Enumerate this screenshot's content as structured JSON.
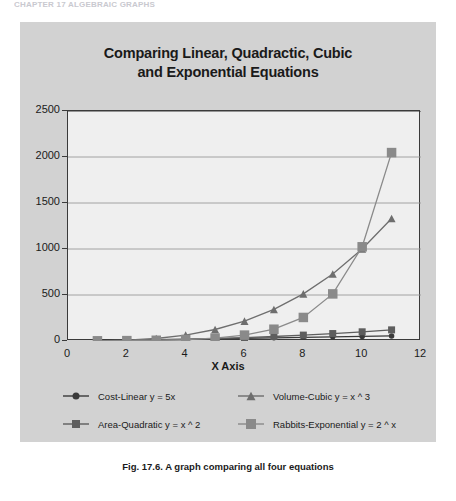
{
  "running_header": "CHAPTER 17 ALGEBRAIC GRAPHS",
  "figure": {
    "caption": "Fig. 17.6. A graph comparing all four equations"
  },
  "colors": {
    "panel_bg": "#d2d2d2",
    "plot_bg": "#efefef",
    "axis": "#3a3a3a",
    "gridline": "#9a9a9a",
    "series_linear": "#3a3a3a",
    "series_quadratic": "#5e5e5e",
    "series_cubic": "#6e6e6e",
    "series_exponential": "#8a8a8a",
    "title_text": "#1a1a1a"
  },
  "chart_data": {
    "type": "line",
    "title": "Comparing Linear, Quadractic, Cubic and Exponential Equations",
    "title_lines": [
      "Comparing Linear, Quadractic, Cubic",
      "and Exponential Equations"
    ],
    "xlabel": "X Axis",
    "ylabel": "",
    "xlim": [
      0,
      12
    ],
    "ylim": [
      0,
      2500
    ],
    "xticks": [
      0,
      2,
      4,
      6,
      8,
      10,
      12
    ],
    "xtick_labels": [
      "0",
      "2",
      "4",
      "6",
      "8",
      "10",
      "12"
    ],
    "yticks": [
      0,
      500,
      1000,
      1500,
      2000,
      2500
    ],
    "ytick_labels": [
      "0",
      "500",
      "1000",
      "1500",
      "2000",
      "2500"
    ],
    "grid": "horizontal",
    "legend_position": "bottom",
    "x": [
      1,
      2,
      3,
      4,
      5,
      6,
      7,
      8,
      9,
      10,
      11
    ],
    "series": [
      {
        "name": "Cost-Linear y = 5x",
        "marker": "circle",
        "color": "#3a3a3a",
        "values": [
          5,
          10,
          15,
          20,
          25,
          30,
          35,
          40,
          45,
          50,
          55
        ]
      },
      {
        "name": "Area-Quadratic y = x ^ 2",
        "marker": "square",
        "color": "#5e5e5e",
        "values": [
          1,
          4,
          9,
          16,
          25,
          36,
          49,
          64,
          81,
          100,
          121
        ]
      },
      {
        "name": "Volume-Cubic y = x ^ 3",
        "marker": "triangle",
        "color": "#6e6e6e",
        "values": [
          1,
          8,
          27,
          64,
          125,
          216,
          343,
          512,
          729,
          1000,
          1331
        ]
      },
      {
        "name": "Rabbits-Exponential y = 2 ^ x",
        "marker": "square",
        "color": "#8a8a8a",
        "values": [
          2,
          4,
          8,
          16,
          32,
          64,
          128,
          256,
          512,
          1024,
          2048
        ]
      }
    ]
  }
}
